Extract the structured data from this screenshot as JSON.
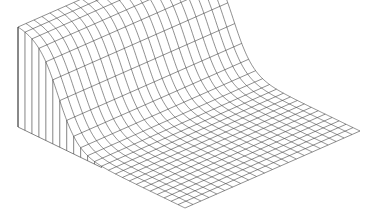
{
  "chart_data": {
    "type": "surface-wireframe",
    "title": "",
    "xlabel": "",
    "ylabel": "",
    "zlabel": "",
    "grid": {
      "u_cells": 24,
      "v_cells": 22
    },
    "surface": {
      "function": "z = H * (1 - smoothstep) along u; plateau for u < 0.12, falls to ~0 by u = 0.45",
      "plateau_height": 1.0,
      "floor_height": 0.0,
      "plateau_end_u": 0.12,
      "fall_center_u": 0.24,
      "fall_width_u": 0.06
    },
    "projection": {
      "origin_front_left_base": [
        18,
        127
      ],
      "u_axis_end": [
        185,
        208
      ],
      "v_axis_end": [
        193,
        50
      ],
      "height_px": 100
    },
    "colors": {
      "line": "#333333",
      "background": "#ffffff"
    },
    "axes_visible": false,
    "legend": null
  }
}
